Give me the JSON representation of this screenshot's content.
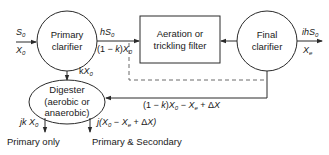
{
  "diagram": {
    "type": "wastewater treatment process flow",
    "nodes": {
      "primary_clarifier": {
        "line1": "Primary",
        "line2": "clarifier",
        "shape": "circle"
      },
      "aeration": {
        "line1": "Aeration or",
        "line2": "trickling filter",
        "shape": "rectangle"
      },
      "final_clarifier": {
        "line1": "Final",
        "line2": "clarifier",
        "shape": "circle"
      },
      "digester": {
        "line1": "Digester",
        "line2": "(aerobic or",
        "line3": "anaerobic)",
        "shape": "ellipse"
      }
    },
    "edges": {
      "influent_top": {
        "var": "S",
        "sub": "0"
      },
      "influent_bottom": {
        "var": "X",
        "sub": "0"
      },
      "pc_to_aer_top": {
        "prefix": "h",
        "var": "S",
        "sub": "0"
      },
      "pc_to_aer_bottom": {
        "prefix": "(1 − ",
        "k": "k",
        "mid": ")",
        "var": "X",
        "sub": "0"
      },
      "pc_to_dig": {
        "prefix": "k",
        "var": "X",
        "sub": "0"
      },
      "effluent_top": {
        "prefix": "ih",
        "var": "S",
        "sub": "0"
      },
      "effluent_bottom": {
        "var": "X",
        "sub": "e"
      },
      "return_sludge": {
        "text_a": "(1 − ",
        "k": "k",
        "text_b": ")",
        "x0": "X",
        "x0_sub": "0",
        "minus": " − ",
        "xe": "X",
        "xe_sub": "e",
        "plus": " + Δ",
        "dx": "X"
      },
      "out_primary": {
        "prefix": "jk ",
        "var": "X",
        "sub": "0"
      },
      "out_secondary": {
        "prefix": "j(",
        "x0": "X",
        "x0_sub": "0",
        "minus": " − ",
        "xe": "X",
        "xe_sub": "e",
        "plus": " + Δ",
        "dx": "X",
        "close": ")"
      }
    },
    "captions": {
      "primary_only": "Primary only",
      "primary_secondary": "Primary & Secondary"
    },
    "colors": {
      "stroke": "#2a2a2a",
      "dashed": "#6a6a6a",
      "text": "#1a1a1a"
    }
  }
}
